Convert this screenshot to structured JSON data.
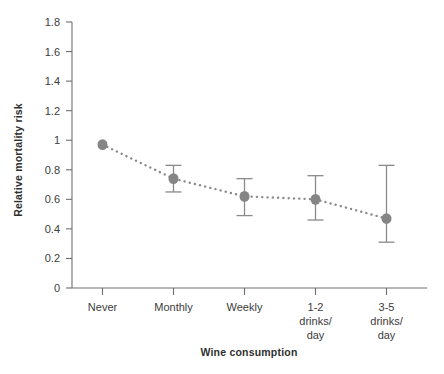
{
  "chart_data": {
    "type": "scatter",
    "title": "",
    "xlabel": "Wine consumption",
    "ylabel": "Relative mortality risk",
    "categories": [
      "Never",
      "Monthly",
      "Weekly",
      "1-2 drinks/ day",
      "3-5 drinks/ day"
    ],
    "category_lines": [
      [
        "Never"
      ],
      [
        "Monthly"
      ],
      [
        "Weekly"
      ],
      [
        "1-2",
        "drinks/",
        "day"
      ],
      [
        "3-5",
        "drinks/",
        "day"
      ]
    ],
    "values": [
      0.97,
      0.74,
      0.62,
      0.6,
      0.47
    ],
    "error_low": [
      0.97,
      0.65,
      0.49,
      0.46,
      0.31
    ],
    "error_high": [
      0.97,
      0.83,
      0.74,
      0.76,
      0.83
    ],
    "ylim": [
      0,
      1.8
    ],
    "yticks": [
      0,
      0.2,
      0.4,
      0.6,
      0.8,
      1,
      1.2,
      1.4,
      1.6,
      1.8
    ],
    "ytick_labels": [
      "0",
      "0.2",
      "0.4",
      "0.6",
      "0.8",
      "1",
      "1.2",
      "1.4",
      "1.6",
      "1.8"
    ],
    "grid": false,
    "legend": "none",
    "line_style": "dotted",
    "marker": "circle",
    "colors": {
      "marker": "#858585",
      "line": "#8a8a8a",
      "error_bar": "#8a8a8a",
      "axis": "#6e6e6e",
      "text": "#3c3c3c",
      "background": "#ffffff"
    }
  }
}
